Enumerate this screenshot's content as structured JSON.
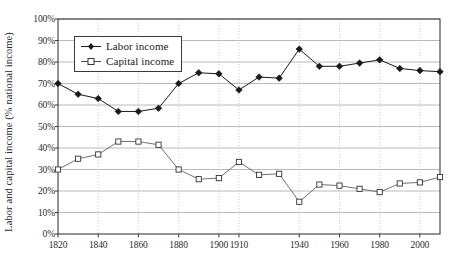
{
  "chart_data": {
    "type": "line",
    "title": "",
    "xlabel": "",
    "ylabel": "Labor and capital income (% national income)",
    "x": [
      1820,
      1830,
      1840,
      1850,
      1860,
      1870,
      1880,
      1890,
      1900,
      1910,
      1920,
      1930,
      1940,
      1950,
      1960,
      1970,
      1980,
      1990,
      2000,
      2010
    ],
    "xtick_labels": [
      "1820",
      "1840",
      "1860",
      "1880",
      "1900",
      "1910",
      "1940",
      "1960",
      "1980",
      "2000"
    ],
    "xtick_values": [
      1820,
      1840,
      1860,
      1880,
      1900,
      1910,
      1940,
      1960,
      1980,
      2000
    ],
    "ytick_labels": [
      "0%",
      "10%",
      "20%",
      "30%",
      "40%",
      "50%",
      "60%",
      "70%",
      "80%",
      "90%",
      "100%"
    ],
    "ytick_values": [
      0,
      10,
      20,
      30,
      40,
      50,
      60,
      70,
      80,
      90,
      100
    ],
    "ylim": [
      0,
      100
    ],
    "xlim": [
      1820,
      2010
    ],
    "grid": "horizontal solid gray, vertical dotted gray",
    "legend_position": "top-left inside plot",
    "series": [
      {
        "name": "Labor income",
        "marker": "filled-diamond",
        "color": "#1a1a1a",
        "values": [
          70,
          65,
          63,
          57,
          57,
          58.5,
          70,
          75,
          74.5,
          67,
          73,
          72.5,
          86,
          78,
          78,
          79.5,
          81,
          77,
          76,
          75.5
        ]
      },
      {
        "name": "Capital income",
        "marker": "open-square",
        "color": "#555555",
        "values": [
          30,
          35,
          37,
          43,
          43,
          41.5,
          30,
          25.5,
          26,
          33.5,
          27.5,
          28,
          15,
          23,
          22.5,
          21,
          19.5,
          23.5,
          24,
          26.5
        ]
      }
    ]
  },
  "legend": {
    "items": [
      {
        "label": "Labor income",
        "marker": "filled-diamond"
      },
      {
        "label": "Capital income",
        "marker": "open-square"
      }
    ]
  },
  "colors": {
    "axis": "#3a3a3a",
    "grid_h": "#a8a8a8",
    "grid_v": "#c0c0c0",
    "labor": "#1a1a1a",
    "capital": "#606060",
    "background": "#ffffff"
  }
}
